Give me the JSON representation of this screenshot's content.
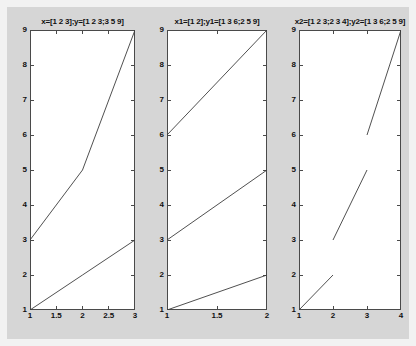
{
  "figure": {
    "background_color": "#d6d6d6",
    "window_color": "#f2f2f2",
    "axes_background": "#ffffff",
    "axes_border_color": "#4a4a4a",
    "line_color": "#3c3c3c"
  },
  "chart_data": [
    {
      "type": "line",
      "title": "x=[1 2 3];y=[1 2 3;3 5 9]",
      "xlabel": "",
      "ylabel": "",
      "xlim": [
        1,
        3
      ],
      "ylim": [
        1,
        9
      ],
      "grid": false,
      "legend": "none",
      "xticks": [
        1,
        1.5,
        2,
        2.5,
        3
      ],
      "xticklabels": [
        "1",
        "1.5",
        "2",
        "2.5",
        "3"
      ],
      "yticks": [
        1,
        2,
        3,
        4,
        5,
        6,
        7,
        8,
        9
      ],
      "yticklabels": [
        "1",
        "2",
        "3",
        "4",
        "5",
        "6",
        "7",
        "8",
        "9"
      ],
      "series": [
        {
          "name": "row1",
          "x": [
            1,
            2,
            3
          ],
          "values": [
            1,
            2,
            3
          ]
        },
        {
          "name": "row2",
          "x": [
            1,
            2,
            3
          ],
          "values": [
            3,
            5,
            9
          ]
        }
      ]
    },
    {
      "type": "line",
      "title": "x1=[1 2];y1=[1 3 6;2 5 9]",
      "xlabel": "",
      "ylabel": "",
      "xlim": [
        1,
        2
      ],
      "ylim": [
        1,
        9
      ],
      "grid": false,
      "legend": "none",
      "xticks": [
        1,
        1.5,
        2
      ],
      "xticklabels": [
        "1",
        "1.5",
        "2"
      ],
      "yticks": [
        1,
        2,
        3,
        4,
        5,
        6,
        7,
        8,
        9
      ],
      "yticklabels": [
        "1",
        "2",
        "3",
        "4",
        "5",
        "6",
        "7",
        "8",
        "9"
      ],
      "series": [
        {
          "name": "col1",
          "x": [
            1,
            2
          ],
          "values": [
            1,
            2
          ]
        },
        {
          "name": "col2",
          "x": [
            1,
            2
          ],
          "values": [
            3,
            5
          ]
        },
        {
          "name": "col3",
          "x": [
            1,
            2
          ],
          "values": [
            6,
            9
          ]
        }
      ]
    },
    {
      "type": "line",
      "title": "x2=[1 2 3;2 3 4];y2=[1 3 6;2 5 9]",
      "xlabel": "",
      "ylabel": "",
      "xlim": [
        1,
        4
      ],
      "ylim": [
        1,
        9
      ],
      "grid": false,
      "legend": "none",
      "xticks": [
        1,
        2,
        3,
        4
      ],
      "xticklabels": [
        "1",
        "2",
        "3",
        "4"
      ],
      "yticks": [
        1,
        2,
        3,
        4,
        5,
        6,
        7,
        8,
        9
      ],
      "yticklabels": [
        "1",
        "2",
        "3",
        "4",
        "5",
        "6",
        "7",
        "8",
        "9"
      ],
      "series": [
        {
          "name": "seg1",
          "x": [
            1,
            2
          ],
          "values": [
            1,
            2
          ]
        },
        {
          "name": "seg2",
          "x": [
            2,
            3
          ],
          "values": [
            3,
            5
          ]
        },
        {
          "name": "seg3",
          "x": [
            3,
            4
          ],
          "values": [
            6,
            9
          ]
        }
      ]
    }
  ],
  "layout": {
    "subplots": [
      {
        "left": 23,
        "top": 23,
        "width": 105,
        "height": 280
      },
      {
        "left": 160,
        "top": 23,
        "width": 100,
        "height": 280
      },
      {
        "left": 292,
        "top": 23,
        "width": 102,
        "height": 280
      }
    ]
  }
}
